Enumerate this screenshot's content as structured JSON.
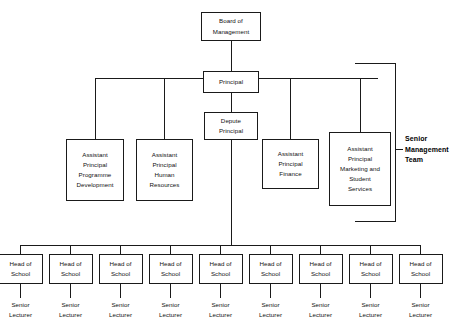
{
  "chart_title": "Organisational Structure Chart",
  "nodes": {
    "board": {
      "label": "Board of\nManagement",
      "line1": "Board of",
      "line2": "Management"
    },
    "principal": {
      "label": "Principal"
    },
    "depute": {
      "line1": "Depute",
      "line2": "Principal"
    },
    "ap_programme": {
      "line1": "Assistant",
      "line2": "Principal",
      "line3": "Programme",
      "line4": "Development"
    },
    "ap_hr": {
      "line1": "Assistant",
      "line2": "Principal",
      "line3": "Human",
      "line4": "Resources"
    },
    "ap_finance": {
      "line1": "Assistant",
      "line2": "Principal",
      "line3": "Finance"
    },
    "ap_marketing": {
      "line1": "Assistant",
      "line2": "Principal",
      "line3": "Marketing and",
      "line4": "Student",
      "line5": "Services"
    }
  },
  "senior_management_team": {
    "line1": "Senior",
    "line2": "Management",
    "line3": "Team"
  },
  "school_row": {
    "head_line1": "Head of",
    "head_line2": "School",
    "lecturer_line1": "Senior",
    "lecturer_line2": "Lecturer",
    "count": 9,
    "items": [
      {
        "head_line1": "Head of",
        "head_line2": "School",
        "lecturer_line1": "Senior",
        "lecturer_line2": "Lecturer"
      },
      {
        "head_line1": "Head of",
        "head_line2": "School",
        "lecturer_line1": "Senior",
        "lecturer_line2": "Lecturer"
      },
      {
        "head_line1": "Head of",
        "head_line2": "School",
        "lecturer_line1": "Senior",
        "lecturer_line2": "Lecturer"
      },
      {
        "head_line1": "Head of",
        "head_line2": "School",
        "lecturer_line1": "Senior",
        "lecturer_line2": "Lecturer"
      },
      {
        "head_line1": "Head of",
        "head_line2": "School",
        "lecturer_line1": "Senior",
        "lecturer_line2": "Lecturer"
      },
      {
        "head_line1": "Head of",
        "head_line2": "School",
        "lecturer_line1": "Senior",
        "lecturer_line2": "Lecturer"
      },
      {
        "head_line1": "Head of",
        "head_line2": "School",
        "lecturer_line1": "Senior",
        "lecturer_line2": "Lecturer"
      },
      {
        "head_line1": "Head of",
        "head_line2": "School",
        "lecturer_line1": "Senior",
        "lecturer_line2": "Lecturer"
      },
      {
        "head_line1": "Head of",
        "head_line2": "School",
        "lecturer_line1": "Senior",
        "lecturer_line2": "Lecturer"
      }
    ]
  },
  "colors": {
    "line": "#1a1a1a",
    "text": "#111111",
    "background": "#ffffff"
  }
}
